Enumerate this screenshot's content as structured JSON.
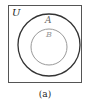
{
  "diagram": {
    "type": "venn",
    "universe_label": "U",
    "sets": [
      {
        "label": "A",
        "color": "#333333"
      },
      {
        "label": "B",
        "color": "#999999"
      }
    ],
    "relationship": "B is a subset of A",
    "caption": "(a)",
    "colors": {
      "frame": "#555555",
      "background": "#ffffff"
    }
  }
}
